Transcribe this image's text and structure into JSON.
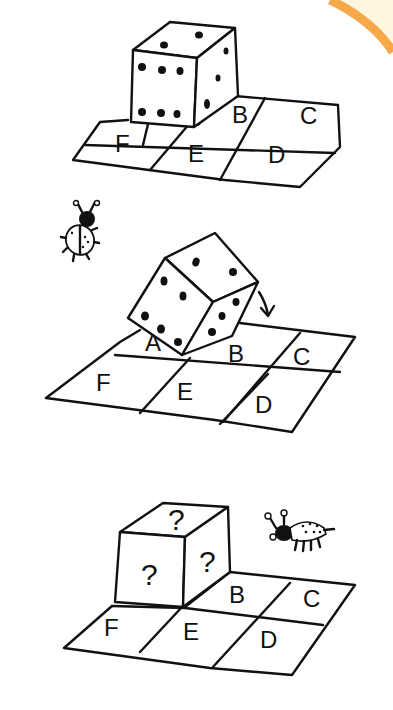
{
  "decor": {
    "corner_arc_color": "#f6a94a",
    "corner_fill_color": "#fff6df"
  },
  "panels": [
    {
      "id": "panel-1",
      "grid_labels": {
        "B": "B",
        "C": "C",
        "D": "D",
        "E": "E",
        "F": "F"
      },
      "die": {
        "top": 2,
        "front": 6,
        "right": 3
      }
    },
    {
      "id": "panel-2",
      "grid_labels": {
        "A": "A",
        "B": "B",
        "C": "C",
        "D": "D",
        "E": "E",
        "F": "F"
      },
      "die": {
        "top": 2,
        "front": 5,
        "right": 3,
        "motion": "rolling right"
      }
    },
    {
      "id": "panel-3",
      "grid_labels": {
        "B": "B",
        "C": "C",
        "D": "D",
        "E": "E",
        "F": "F"
      },
      "die": {
        "top": "?",
        "front": "?",
        "right": "?"
      }
    }
  ]
}
